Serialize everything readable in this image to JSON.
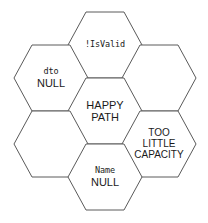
{
  "diagram": {
    "type": "hexagon-honeycomb",
    "background_color": "#ffffff",
    "stroke_color": "#5a5a5a",
    "text_color": "#1a1a1a",
    "cells": [
      {
        "id": "is-valid",
        "position": "top-center",
        "cx": 105,
        "cy": 45,
        "empty": false,
        "lines": [
          {
            "text": "!IsValid",
            "style": "mono"
          }
        ]
      },
      {
        "id": "dto-null",
        "position": "upper-left",
        "cx": 51,
        "cy": 78,
        "empty": false,
        "lines": [
          {
            "text": "dto",
            "style": "mono"
          },
          {
            "text": "NULL",
            "style": "sans"
          }
        ]
      },
      {
        "id": "empty-upper-right",
        "position": "upper-right",
        "cx": 159,
        "cy": 78,
        "empty": true,
        "lines": []
      },
      {
        "id": "happy-path",
        "position": "center",
        "cx": 105,
        "cy": 111,
        "empty": false,
        "lines": [
          {
            "text": "HAPPY",
            "style": "sans"
          },
          {
            "text": "PATH",
            "style": "sans"
          }
        ]
      },
      {
        "id": "empty-lower-left",
        "position": "lower-left",
        "cx": 51,
        "cy": 144,
        "empty": true,
        "lines": []
      },
      {
        "id": "too-little-capacity",
        "position": "lower-right",
        "cx": 159,
        "cy": 144,
        "empty": false,
        "lines": [
          {
            "text": "TOO",
            "style": "sans-sm"
          },
          {
            "text": "LITTLE",
            "style": "sans-sm"
          },
          {
            "text": "CAPACITY",
            "style": "sans-sm"
          }
        ]
      },
      {
        "id": "name-null",
        "position": "bottom-center",
        "cx": 105,
        "cy": 177,
        "empty": false,
        "lines": [
          {
            "text": "Name",
            "style": "mono"
          },
          {
            "text": "NULL",
            "style": "sans"
          }
        ]
      }
    ],
    "geometry": {
      "half_width": 37,
      "half_height": 33,
      "side_inset": 18
    }
  }
}
